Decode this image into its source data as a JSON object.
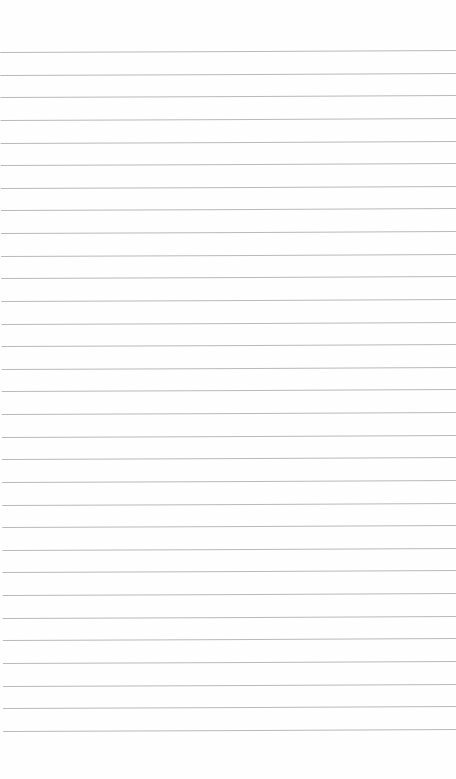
{
  "page": {
    "type": "lined-paper",
    "background_color": "#fefefe",
    "rule_color": "#b9b9b9",
    "rule_count": 31,
    "first_rule_y": 52,
    "rule_spacing": 22.63,
    "text": ""
  }
}
